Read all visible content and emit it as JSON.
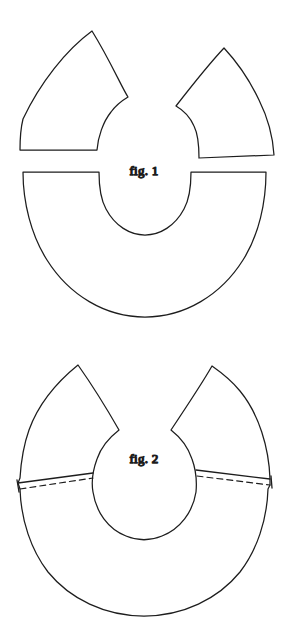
{
  "document": {
    "kind": "line-drawing",
    "subject": "sewing / pattern construction diagram",
    "background_color": "#ffffff",
    "ink_color": "#1d1d1d",
    "width": 289,
    "height": 620
  },
  "figures": [
    {
      "id": "fig-1",
      "label": "fig. 1",
      "label_x": 144,
      "label_y": 175,
      "description": "Three separate flat pattern pieces before assembly",
      "pieces": [
        {
          "name": "left-gusset-wedge",
          "type": "curved-wedge",
          "position": "top-left",
          "apex": [
            92,
            31
          ],
          "notch": [
            128,
            97
          ],
          "base_left": [
            20,
            150
          ],
          "base_right": [
            97,
            150
          ]
        },
        {
          "name": "right-gusset-wedge",
          "type": "curved-wedge",
          "position": "top-right",
          "apex": [
            224,
            48
          ],
          "notch": [
            176,
            106
          ],
          "base_left": [
            199,
            158
          ],
          "base_right": [
            274,
            155
          ]
        },
        {
          "name": "horseshoe-band",
          "type": "half-annulus",
          "position": "bottom",
          "center": [
            144,
            175
          ],
          "outer_radius": 122,
          "inner_radius": 50,
          "opening": "upward"
        }
      ]
    },
    {
      "id": "fig-2",
      "label": "fig. 2",
      "label_x": 144,
      "label_y": 463,
      "description": "The wedges joined to the band forming a closed ring with a notched opening at top; solid lines are the joined seam edges and dashed lines are the stitching lines",
      "pieces": [
        {
          "name": "left-gusset-wedge-attached",
          "type": "curved-wedge",
          "position": "upper-left",
          "apex": [
            78,
            365
          ],
          "notch": [
            119,
            430
          ]
        },
        {
          "name": "right-gusset-wedge-attached",
          "type": "curved-wedge",
          "position": "upper-right",
          "apex": [
            212,
            366
          ],
          "notch": [
            171,
            430
          ]
        },
        {
          "name": "annulus-body",
          "type": "annulus",
          "center": [
            144,
            468
          ],
          "outer_radius": 123,
          "inner_radius": 52
        }
      ],
      "seams": [
        {
          "name": "left-seam",
          "style": "solid",
          "from": [
            18,
            483
          ],
          "to": [
            93,
            473
          ]
        },
        {
          "name": "left-stitch-line",
          "style": "dashed",
          "from": [
            20,
            489
          ],
          "to": [
            93,
            478
          ]
        },
        {
          "name": "right-seam",
          "style": "solid",
          "from": [
            196,
            470
          ],
          "to": [
            270,
            479
          ]
        },
        {
          "name": "right-stitch-line",
          "style": "dashed",
          "from": [
            197,
            476
          ],
          "to": [
            270,
            485
          ]
        }
      ]
    }
  ]
}
